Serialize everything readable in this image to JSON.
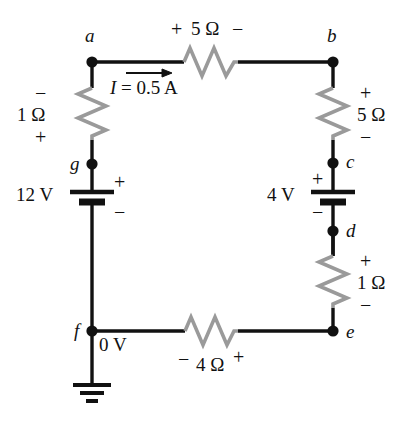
{
  "figure": {
    "type": "circuit-schematic",
    "title": "",
    "colors": {
      "wire": "#111111",
      "resistor": "#9a9a9a",
      "node": "#111111",
      "text": "#111111",
      "background": "#ffffff"
    }
  },
  "nodes": [
    {
      "id": "a",
      "label": "a",
      "x": 92,
      "y": 62
    },
    {
      "id": "b",
      "label": "b",
      "x": 333,
      "y": 62
    },
    {
      "id": "c",
      "label": "c",
      "x": 333,
      "y": 163
    },
    {
      "id": "d",
      "label": "d",
      "x": 333,
      "y": 231
    },
    {
      "id": "e",
      "label": "e",
      "x": 333,
      "y": 331
    },
    {
      "id": "f",
      "label": "f",
      "x": 92,
      "y": 331
    },
    {
      "id": "g",
      "label": "g",
      "x": 92,
      "y": 164
    }
  ],
  "components": {
    "resistor_top": {
      "name": "5-ohm-top-resistor",
      "value": "5 Ω",
      "polarity_left": "+",
      "polarity_right": "−",
      "between": "a-b"
    },
    "resistor_left": {
      "name": "1-ohm-left-resistor",
      "value": "1 Ω",
      "polarity_top": "−",
      "polarity_bottom": "+",
      "between": "a-g"
    },
    "resistor_right_upper": {
      "name": "5-ohm-right-resistor",
      "value": "5 Ω",
      "polarity_top": "+",
      "polarity_bottom": "−",
      "between": "b-c"
    },
    "resistor_right_lower": {
      "name": "1-ohm-right-resistor",
      "value": "1 Ω",
      "polarity_top": "+",
      "polarity_bottom": "−",
      "between": "d-e"
    },
    "resistor_bottom": {
      "name": "4-ohm-bottom-resistor",
      "value": "4 Ω",
      "polarity_left": "−",
      "polarity_right": "+",
      "between": "f-e"
    },
    "battery_left": {
      "name": "12-volt-battery",
      "value": "12 V",
      "terminal_top": "+",
      "terminal_bottom": "−",
      "between": "g-f"
    },
    "battery_right": {
      "name": "4-volt-battery",
      "value": "4 V",
      "terminal_top": "+",
      "terminal_bottom": "−",
      "between": "c-d"
    },
    "ground": {
      "name": "ground-symbol",
      "reference_label": "0 V",
      "at_node": "f"
    }
  },
  "current": {
    "label": "I = 0.5 A",
    "symbol": "I",
    "equals": "=",
    "magnitude": "0.5 A",
    "direction": "right",
    "branch": "a-to-b"
  }
}
